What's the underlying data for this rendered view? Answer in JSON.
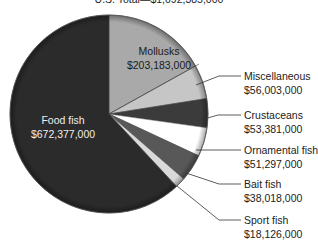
{
  "chart_data": {
    "type": "pie",
    "title": "U.S. Total—$1,092,385,000",
    "units": "USD",
    "start_angle_deg": 0,
    "direction": "clockwise",
    "slices": [
      {
        "label": "Mollusks",
        "value": 203183000,
        "value_text": "$203,183,000",
        "color": "#a9a9a9",
        "start": 0,
        "end": 61,
        "label_inside": true,
        "text_color": "#1a1a1a"
      },
      {
        "label": "Miscellaneous",
        "value": 56003000,
        "value_text": "$56,003,000",
        "color": "#c6c6c6",
        "start": 61,
        "end": 81,
        "label_inside": false
      },
      {
        "label": "Crustaceans",
        "value": 53381000,
        "value_text": "$53,381,000",
        "color": "#3b3b3b",
        "start": 81,
        "end": 98,
        "label_inside": false
      },
      {
        "label": "Ornamental fish",
        "value": 51297000,
        "value_text": "$51,297,000",
        "color": "#ffffff",
        "start": 98,
        "end": 115,
        "label_inside": false
      },
      {
        "label": "Bait fish",
        "value": 38018000,
        "value_text": "$38,018,000",
        "color": "#585858",
        "start": 115,
        "end": 131,
        "label_inside": false
      },
      {
        "label": "Sport fish",
        "value": 18126000,
        "value_text": "$18,126,000",
        "color": "#dadada",
        "start": 131,
        "end": 137,
        "label_inside": false
      },
      {
        "label": "Food fish",
        "value": 672377000,
        "value_text": "$672,377,000",
        "color": "#2b2b2b",
        "start": 137,
        "end": 360,
        "label_inside": true,
        "text_color": "#f0f0f0"
      }
    ],
    "legend": "none (callout labels)"
  },
  "labels": {
    "title": "U.S. Total—$1,092,385,000",
    "mollusks": {
      "name": "Mollusks",
      "value": "$203,183,000"
    },
    "food_fish": {
      "name": "Food fish",
      "value": "$672,377,000"
    },
    "miscellaneous": {
      "name": "Miscellaneous",
      "value": "$56,003,000"
    },
    "crustaceans": {
      "name": "Crustaceans",
      "value": "$53,381,000"
    },
    "ornamental_fish": {
      "name": "Ornamental fish",
      "value": "$51,297,000"
    },
    "bait_fish": {
      "name": "Bait fish",
      "value": "$38,018,000"
    },
    "sport_fish": {
      "name": "Sport fish",
      "value": "$18,126,000"
    }
  }
}
